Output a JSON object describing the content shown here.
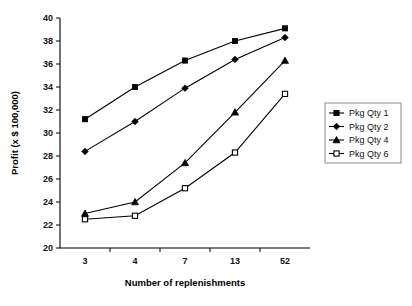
{
  "chart_data": {
    "type": "line",
    "title": "",
    "xlabel": "Number of replenishments",
    "ylabel": "Profit (x $ 100,000)",
    "categories": [
      "3",
      "4",
      "7",
      "13",
      "52"
    ],
    "ylim": [
      20,
      40
    ],
    "yticks": [
      "20",
      "22",
      "24",
      "26",
      "28",
      "30",
      "32",
      "34",
      "36",
      "38",
      "40"
    ],
    "grid": false,
    "legend_position": "right",
    "series": [
      {
        "name": "Pkg Qty 1",
        "marker": "filled-square",
        "values": [
          31.2,
          34.0,
          36.3,
          38.0,
          39.1
        ]
      },
      {
        "name": "Pkg Qty 2",
        "marker": "filled-diamond",
        "values": [
          28.4,
          31.0,
          33.9,
          36.4,
          38.3
        ]
      },
      {
        "name": "Pkg Qty 4",
        "marker": "filled-triangle",
        "values": [
          23.0,
          24.0,
          27.4,
          31.8,
          36.3
        ]
      },
      {
        "name": "Pkg Qty 6",
        "marker": "open-square",
        "values": [
          22.5,
          22.8,
          25.2,
          28.3,
          33.4
        ]
      }
    ]
  },
  "colors": {
    "ink": "#000000",
    "background": "#ffffff",
    "legend_border": "#8a8a8a"
  }
}
